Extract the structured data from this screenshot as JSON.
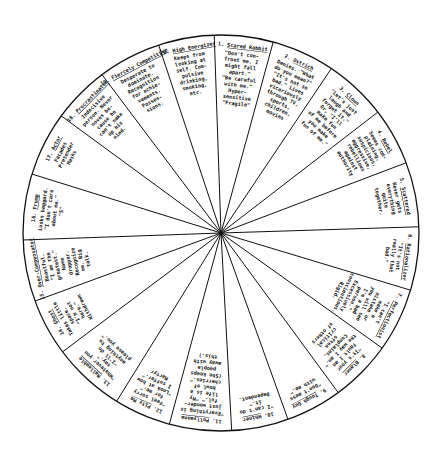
{
  "diagram": {
    "type": "wheel",
    "center": [
      221,
      233
    ],
    "radius": 198,
    "stroke_color": "#111111",
    "background": "#ffffff",
    "boundary_points": [
      [
        214,
        28
      ],
      [
        274,
        39
      ],
      [
        333,
        66
      ],
      [
        378,
        112
      ],
      [
        395,
        167
      ],
      [
        412,
        227
      ],
      [
        410,
        290
      ],
      [
        382,
        348
      ],
      [
        340,
        395
      ],
      [
        290,
        425
      ],
      [
        232,
        437
      ],
      [
        167,
        433
      ],
      [
        110,
        412
      ],
      [
        65,
        350
      ],
      [
        38,
        300
      ],
      [
        23,
        240
      ],
      [
        35,
        175
      ],
      [
        60,
        115
      ],
      [
        100,
        72
      ],
      [
        157,
        40
      ]
    ],
    "wedges": [
      {
        "number": "1.",
        "title": "Scared Rabbit",
        "lines": [
          "\"Don't con-",
          "front me.  I",
          "might fall",
          "apart.\"",
          "\"Be careful",
          "with me.\"",
          "Hyper-",
          "sensitive",
          "\"Fragile\""
        ]
      },
      {
        "number": "2.",
        "title": "Ostrich",
        "lines": [
          "Denies. \"What",
          "do you mean?\"",
          "\"It's not so",
          "bad.\"  Lives",
          "vicariously",
          "through TV,",
          "sports,",
          "children,",
          "movies"
        ]
      },
      {
        "number": "3.",
        "title": "Clown",
        "lines": [
          "\"Let's just",
          "laugh and",
          "forget it.\"",
          "Or, \"I'll",
          "make fun",
          "of me before",
          "you make",
          "fun of me.\""
        ]
      },
      {
        "number": "4.",
        "title": "Rebel",
        "lines": [
          "Seems com-",
          "plaining,",
          "suspicious,",
          "aggressive,",
          "rebellious",
          "against",
          "authority"
        ]
      },
      {
        "number": "5.",
        "title": "Scattered",
        "lines": [
          "Never gets",
          "everything",
          "quite",
          "together."
        ]
      },
      {
        "number": "6.",
        "title": "Rationalizer",
        "lines": [
          "\"It's not",
          "really that",
          "bad.\""
        ]
      },
      {
        "number": "7.",
        "title": "Perfectionist",
        "lines": [
          "\"I can't",
          "make a",
          "mistake or",
          "you will see",
          "I'm a bad",
          "person.\"",
          "Excessively",
          "conscientious.",
          "Rigid."
        ]
      },
      {
        "number": "8.",
        "title": "Blamer",
        "lines": [
          "\"It's your",
          "fault I am",
          "the way I am.\"",
          "Complains,",
          "often",
          "critical",
          "of others"
        ]
      },
      {
        "number": "9.",
        "title": "Tough Guy",
        "lines": [
          "\"Don't mess",
          "with me.\""
        ]
      },
      {
        "number": "10.",
        "title": "Whiner",
        "lines": [
          "\"I can't do",
          "it.\"",
          "Dependent."
        ]
      },
      {
        "number": "11.",
        "title": "Pollyanna",
        "lines": [
          "\"Everything is",
          "just wonder-",
          "ful.\"  \"My",
          "life is a",
          "bowl of",
          "cherries.\"",
          "(She keeps",
          "people",
          "away with",
          "this.)"
        ]
      },
      {
        "number": "12.",
        "title": "Pity Me",
        "lines": [
          "\"Feel sorry",
          "for me.\"",
          "\"Look at how",
          "I suffer.\"",
          "Martyr"
        ]
      },
      {
        "number": "13.",
        "title": "Malleable",
        "lines": [
          "\"Whatever you",
          "say.\"",
          "\"I'll do",
          "anything to",
          "please you.\""
        ]
      },
      {
        "number": "14.",
        "title": "Ghost",
        "lines": [
          "Takes little",
          "space.",
          "\"I'm not",
          "here.\"",
          "Withdrawn"
        ]
      },
      {
        "number": "15.",
        "title": "Over-Compensator",
        "lines": [
          "Boastful.",
          "\"I am the",
          "greatest.\"",
          "Name",
          "dropper.",
          "Recognize",
          "me.  Big",
          "talk."
        ]
      },
      {
        "number": "16.",
        "title": "Frump",
        "lines": [
          "Looks haggard.",
          "\"I don't care",
          "about me.\"",
          "\"S\""
        ]
      },
      {
        "number": "17.",
        "title": "Actor",
        "lines": [
          "Facades",
          "Pretender",
          "Masks"
        ]
      },
      {
        "number": "18.",
        "title": "Procrastinator",
        "lines": [
          "Indecisive",
          "person. Never",
          "moves be-",
          "cause he",
          "can't make",
          "up his",
          "mind."
        ]
      },
      {
        "number": "19.",
        "title": "Fiercely Competitive",
        "lines": [
          "Desperate to",
          "dominate.",
          "Recognition",
          "for achie-",
          "vements.",
          "Posses-",
          "sions."
        ]
      },
      {
        "number": "20.",
        "title": "High Energizer",
        "lines": [
          "Keeps from",
          "looking at",
          "self.  Com-",
          "pulsive",
          "drinking,",
          "smoking,",
          "etc."
        ]
      }
    ]
  }
}
